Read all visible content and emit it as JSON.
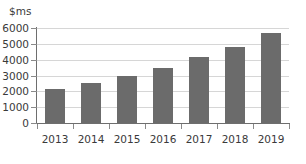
{
  "chart_data": {
    "type": "bar",
    "title": "",
    "subtitle": "",
    "xlabel": "",
    "ylabel": "$ms",
    "categories": [
      "2013",
      "2014",
      "2015",
      "2016",
      "2017",
      "2018",
      "2019"
    ],
    "values": [
      2150,
      2500,
      3000,
      3500,
      4150,
      4800,
      5700
    ],
    "series": [
      {
        "name": "Revenue",
        "values": [
          2150,
          2500,
          3000,
          3500,
          4150,
          4800,
          5700
        ]
      }
    ],
    "ylim": [
      0,
      6000
    ],
    "yticks": [
      0,
      1000,
      2000,
      3000,
      4000,
      5000,
      6000
    ],
    "ytick_labels": [
      "0",
      "1000",
      "2000",
      "3000",
      "4000",
      "5000",
      "6000"
    ],
    "grid": true,
    "legend": false,
    "legend_position": "none",
    "annotations": [],
    "colors": {
      "bar": "#6b6b6b",
      "gridline": "#d6d6d6",
      "axis": "#6e6e6e",
      "tick": "#8a8a8a",
      "text": "#3a3a3a",
      "background": "#ffffff"
    }
  }
}
